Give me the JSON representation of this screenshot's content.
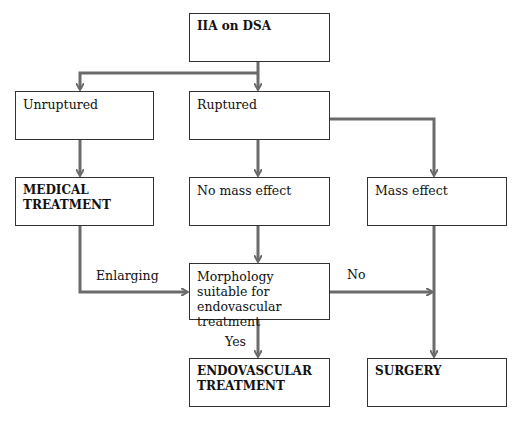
{
  "nodes": {
    "root": "IIA on DSA",
    "unruptured": "Unruptured",
    "ruptured": "Ruptured",
    "medical": "MEDICAL TREATMENT",
    "no_mass": "No mass effect",
    "mass": "Mass effect",
    "morphology": "Morphology suitable for endovascular treatment",
    "endovascular": "ENDOVASCULAR TREATMENT",
    "surgery": "SURGERY"
  },
  "edge_labels": {
    "enlarging": "Enlarging",
    "no": "No",
    "yes": "Yes"
  },
  "colors": {
    "connector": "#6b6b6b",
    "border": "#333333"
  }
}
